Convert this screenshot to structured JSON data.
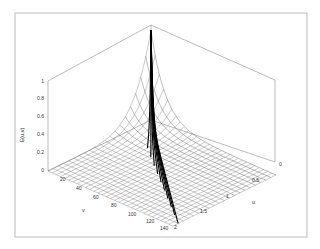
{
  "chart_data": {
    "type": "surface3d",
    "title": "",
    "xlabel": "v",
    "ylabel": "u",
    "zlabel": "E(u,v)",
    "x_ticks": [
      "20",
      "40",
      "60",
      "80",
      "100",
      "120",
      "140"
    ],
    "y_ticks": [
      "0",
      "0.5",
      "1",
      "1.5",
      "2"
    ],
    "z_ticks": [
      "0",
      "0.2",
      "0.4",
      "0.6",
      "0.8",
      "1"
    ],
    "xlim": [
      0,
      150
    ],
    "ylim": [
      0,
      2
    ],
    "zlim": [
      0,
      1
    ]
  },
  "axes": {
    "z_label": "E(u,v)",
    "v_label": "v",
    "u_label": "u"
  },
  "colors": {
    "frame": "#9a9a9a",
    "mesh": "#555555",
    "bold": "#000000",
    "text": "#333333"
  }
}
